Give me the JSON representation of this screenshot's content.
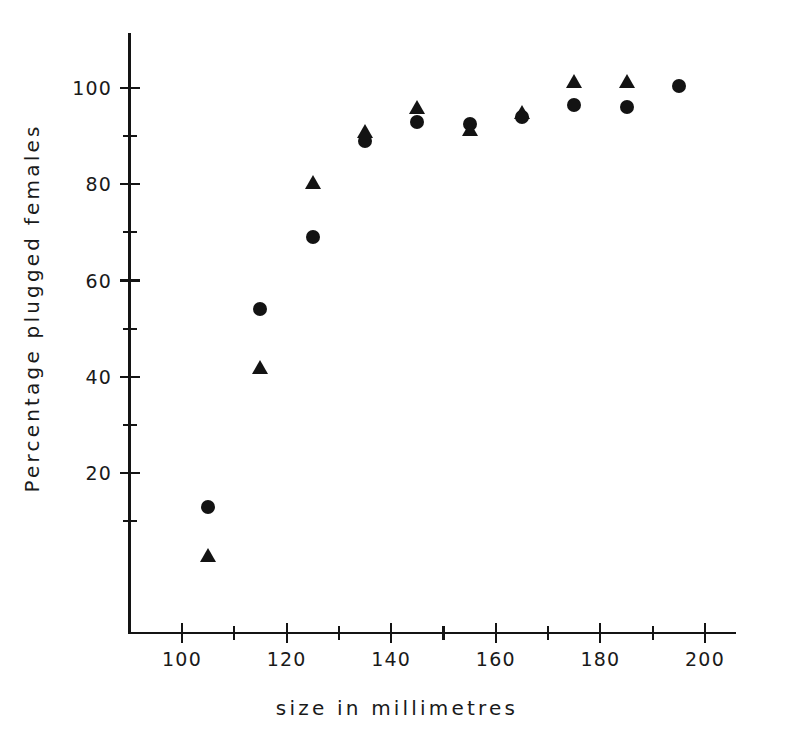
{
  "chart_data": {
    "type": "scatter",
    "title": "",
    "xlabel": "size in millimetres",
    "ylabel": "Percentage plugged females",
    "xlim": [
      92,
      208
    ],
    "ylim": [
      -4,
      112
    ],
    "grid": false,
    "legend": "none",
    "x_major_ticks": [
      100,
      120,
      140,
      160,
      180,
      200
    ],
    "x_minor_ticks": [
      110,
      130,
      150,
      170,
      190
    ],
    "y_major_ticks": [
      20,
      40,
      60,
      80,
      100
    ],
    "y_minor_ticks": [
      10,
      30,
      50,
      70,
      90
    ],
    "x_tick_labels": [
      "100",
      "120",
      "140",
      "160",
      "180",
      "200"
    ],
    "y_tick_labels": [
      "20",
      "40",
      "60",
      "80",
      "100"
    ],
    "series": [
      {
        "name": "circles",
        "marker": "circle",
        "color": "#131313",
        "points": [
          {
            "x": 105,
            "y": 13
          },
          {
            "x": 115,
            "y": 54
          },
          {
            "x": 125,
            "y": 69
          },
          {
            "x": 135,
            "y": 89
          },
          {
            "x": 145,
            "y": 93
          },
          {
            "x": 155,
            "y": 92.5
          },
          {
            "x": 165,
            "y": 94
          },
          {
            "x": 175,
            "y": 96.5
          },
          {
            "x": 185,
            "y": 96
          },
          {
            "x": 195,
            "y": 100.5
          }
        ]
      },
      {
        "name": "triangles",
        "marker": "triangle",
        "color": "#131313",
        "points": [
          {
            "x": 105,
            "y": 3
          },
          {
            "x": 115,
            "y": 42
          },
          {
            "x": 125,
            "y": 80.5
          },
          {
            "x": 135,
            "y": 91
          },
          {
            "x": 145,
            "y": 96
          },
          {
            "x": 155,
            "y": 91.5
          },
          {
            "x": 165,
            "y": 95
          },
          {
            "x": 175,
            "y": 101.5
          },
          {
            "x": 185,
            "y": 101.5
          }
        ]
      }
    ]
  }
}
